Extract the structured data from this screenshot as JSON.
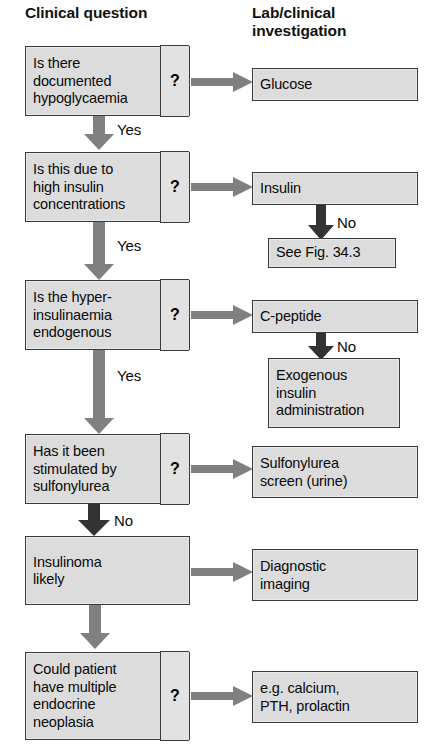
{
  "headers": {
    "clinical": "Clinical question",
    "lab": "Lab/clinical\ninvestigation"
  },
  "question_mark": "?",
  "questions": [
    {
      "id": "q1",
      "text": "Is there\ndocumented\nhypoglycaemia",
      "marker": "?"
    },
    {
      "id": "q2",
      "text": "Is this due to\nhigh insulin\nconcentrations",
      "marker": "?"
    },
    {
      "id": "q3",
      "text": "Is the hyper-\ninsulinaemia\nendogenous",
      "marker": "?"
    },
    {
      "id": "q4",
      "text": "Has it been\nstimulated by\nsulfonylurea",
      "marker": "?"
    },
    {
      "id": "q5",
      "text": "Insulinoma\nlikely",
      "marker": ""
    },
    {
      "id": "q6",
      "text": "Could patient\nhave multiple\nendocrine\nneoplasia",
      "marker": "?"
    }
  ],
  "investigations": [
    {
      "id": "i1",
      "text": "Glucose"
    },
    {
      "id": "i2",
      "text": "Insulin"
    },
    {
      "id": "i3",
      "text": "See Fig. 34.3"
    },
    {
      "id": "i4",
      "text": "C-peptide"
    },
    {
      "id": "i5",
      "text": "Exogenous\ninsulin\nadministration"
    },
    {
      "id": "i6",
      "text": "Sulfonylurea\nscreen (urine)"
    },
    {
      "id": "i7",
      "text": "Diagnostic\nimaging"
    },
    {
      "id": "i8",
      "text": "e.g. calcium,\nPTH, prolactin"
    }
  ],
  "edge_labels": {
    "yes1": "Yes",
    "yes2": "Yes",
    "yes3": "Yes",
    "no_fig": "No",
    "no_exog": "No",
    "no_insulinoma": "No"
  },
  "colors": {
    "box_fill": "#dcdcdc",
    "box_border": "#3b3b3b",
    "arrow_gray": "#808080",
    "arrow_dark": "#333333",
    "text": "#0a0a0a",
    "background": "#ffffff"
  }
}
